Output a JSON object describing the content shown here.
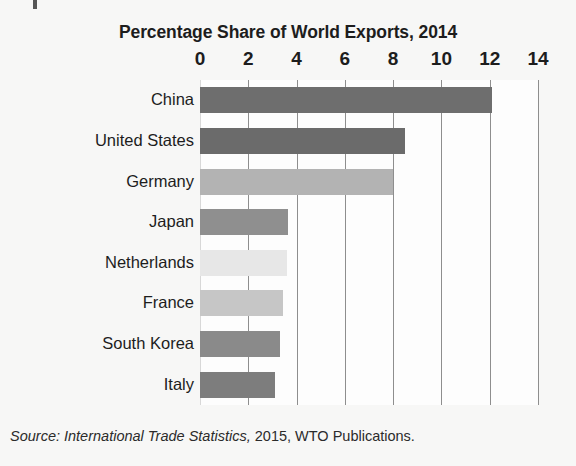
{
  "figure": {
    "title": "Percentage Share of World Exports, 2014",
    "source_italic": "Source: International Trade Statistics,",
    "source_rest": " 2015, WTO Publications."
  },
  "axis": {
    "tick_labels": [
      "0",
      "2",
      "4",
      "6",
      "8",
      "10",
      "12",
      "14"
    ]
  },
  "chart_data": {
    "type": "bar",
    "orientation": "horizontal",
    "title": "Percentage Share of World Exports, 2014",
    "xlabel": "",
    "ylabel": "",
    "xlim": [
      0,
      14
    ],
    "ticks": [
      0,
      2,
      4,
      6,
      8,
      10,
      12,
      14
    ],
    "grid": true,
    "legend": "none",
    "categories": [
      "China",
      "United States",
      "Germany",
      "Japan",
      "Netherlands",
      "France",
      "South Korea",
      "Italy"
    ],
    "values": [
      12.1,
      8.5,
      8.0,
      3.65,
      3.6,
      3.45,
      3.3,
      3.1
    ],
    "bar_colors": [
      "#6e6e6e",
      "#6b6b6b",
      "#b3b3b3",
      "#8f8f8f",
      "#e7e7e7",
      "#c6c6c6",
      "#8a8a8a",
      "#7d7d7d"
    ],
    "annotation": "Source: International Trade Statistics, 2015, WTO Publications."
  }
}
